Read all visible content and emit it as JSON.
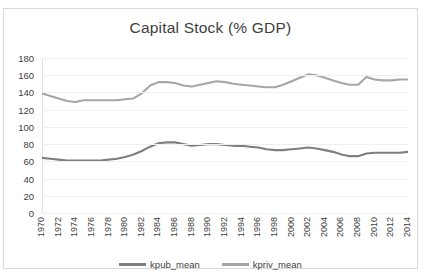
{
  "chart_data": {
    "type": "line",
    "title": "Capital Stock (% GDP)",
    "xlabel": "",
    "ylabel": "",
    "ylim": [
      0,
      180
    ],
    "ytick_step": 20,
    "yticks": [
      180,
      160,
      140,
      120,
      100,
      80,
      60,
      40,
      20,
      0
    ],
    "grid": true,
    "legend_position": "bottom",
    "xtick_labels": [
      "1970",
      "1972",
      "1974",
      "1976",
      "1978",
      "1980",
      "1982",
      "1984",
      "1986",
      "1988",
      "1990",
      "1992",
      "1994",
      "1996",
      "1998",
      "2000",
      "2002",
      "2004",
      "2006",
      "2008",
      "2010",
      "2012",
      "2014"
    ],
    "x": [
      1970,
      1971,
      1972,
      1973,
      1974,
      1975,
      1976,
      1977,
      1978,
      1979,
      1980,
      1981,
      1982,
      1983,
      1984,
      1985,
      1986,
      1987,
      1988,
      1989,
      1990,
      1991,
      1992,
      1993,
      1994,
      1995,
      1996,
      1997,
      1998,
      1999,
      2000,
      2001,
      2002,
      2003,
      2004,
      2005,
      2006,
      2007,
      2008,
      2009,
      2010,
      2011,
      2012,
      2013,
      2014
    ],
    "series": [
      {
        "name": "kpub_mean",
        "color": "#7f7f7f",
        "values": [
          64,
          63,
          62,
          61,
          61,
          61,
          61,
          61,
          62,
          63,
          65,
          68,
          72,
          77,
          81,
          82,
          82,
          80,
          78,
          79,
          80,
          80,
          79,
          78,
          78,
          77,
          76,
          74,
          73,
          73,
          74,
          75,
          76,
          75,
          73,
          71,
          68,
          66,
          66,
          69,
          70,
          70,
          70,
          70,
          71
        ]
      },
      {
        "name": "kpriv_mean",
        "color": "#a6a6a6",
        "values": [
          139,
          136,
          133,
          130,
          129,
          131,
          131,
          131,
          131,
          131,
          132,
          133,
          139,
          148,
          152,
          152,
          151,
          148,
          147,
          149,
          151,
          153,
          152,
          150,
          149,
          148,
          147,
          146,
          146,
          149,
          153,
          157,
          161,
          160,
          157,
          154,
          151,
          149,
          149,
          158,
          155,
          154,
          154,
          155,
          155
        ]
      }
    ]
  },
  "legend": {
    "items": [
      {
        "label": "kpub_mean"
      },
      {
        "label": "kpriv_mean"
      }
    ]
  }
}
